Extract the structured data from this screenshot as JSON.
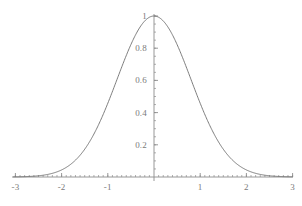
{
  "chart_data": {
    "type": "line",
    "title": "",
    "subtitle": "",
    "xlabel": "",
    "ylabel": "",
    "xlim": [
      -3.05,
      3.0
    ],
    "ylim": [
      0,
      1.02
    ],
    "grid": false,
    "legend": null,
    "axis_color": "#8c8c8c",
    "curve_color": "#6e6e6e",
    "label_color": "#7a7a7a",
    "background": "#ffffff",
    "x_ticks_major": [
      -3,
      -2,
      -1,
      1,
      2,
      3
    ],
    "x_tick_labels": [
      "-3",
      "-2",
      "-1",
      "1",
      "2",
      "3"
    ],
    "y_ticks_major": [
      0.2,
      0.4,
      0.6,
      0.8,
      1
    ],
    "y_tick_labels": [
      "0.2",
      "0.4",
      "0.6",
      "0.8",
      "1"
    ],
    "x_minor_step": 0.1,
    "y_minor_step": 0.05,
    "series": [
      {
        "name": "gaussian",
        "peak": 1,
        "mean": 0,
        "sigma": 0.8,
        "x": [
          -3.0,
          -2.8,
          -2.6,
          -2.4,
          -2.2,
          -2.0,
          -1.8,
          -1.6,
          -1.4,
          -1.2,
          -1.0,
          -0.8,
          -0.6,
          -0.4,
          -0.2,
          0.0,
          0.2,
          0.4,
          0.6,
          0.8,
          1.0,
          1.2,
          1.4,
          1.6,
          1.8,
          2.0,
          2.2,
          2.4,
          2.6,
          2.8,
          3.0
        ],
        "values": [
          0.0008,
          0.0021,
          0.0054,
          0.0129,
          0.0286,
          0.0439,
          0.0796,
          0.1353,
          0.2163,
          0.3246,
          0.4578,
          0.6065,
          0.7548,
          0.8825,
          0.9692,
          1.0,
          0.9692,
          0.8825,
          0.7548,
          0.6065,
          0.4578,
          0.3246,
          0.2163,
          0.1353,
          0.0796,
          0.0439,
          0.0286,
          0.0129,
          0.0054,
          0.0021,
          0.0008
        ]
      }
    ]
  },
  "labels": {
    "x": [
      "-3",
      "-2",
      "-1",
      "1",
      "2",
      "3"
    ],
    "y": [
      "0.2",
      "0.4",
      "0.6",
      "0.8",
      "1"
    ]
  },
  "icons": {
    "curve": "gaussian-curve",
    "x_axis": "horizontal-axis-line",
    "y_axis": "vertical-axis-line"
  }
}
